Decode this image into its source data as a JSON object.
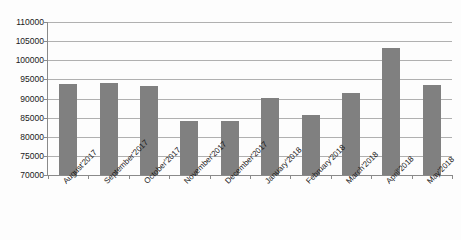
{
  "chart_data": {
    "type": "bar",
    "title": "",
    "subtitle": "",
    "xlabel": "",
    "ylabel": "",
    "categories": [
      "August'2017",
      "September'2017",
      "October'2017",
      "November'2017",
      "December'2017",
      "January'2018",
      "February'2018",
      "March'2018",
      "April'2018",
      "May'2018"
    ],
    "values": [
      93800,
      94000,
      93400,
      84000,
      84100,
      90100,
      85600,
      91500,
      103100,
      93600
    ],
    "ylim": [
      70000,
      110000
    ],
    "ytick_labels": [
      "110000",
      "105000",
      "100000",
      "95000",
      "90000",
      "85000",
      "80000",
      "75000",
      "70000"
    ],
    "ytick_values": [
      110000,
      105000,
      100000,
      95000,
      90000,
      85000,
      80000,
      75000,
      70000
    ],
    "grid": true,
    "legend": false,
    "legend_position": "none",
    "bar_color": "#808080",
    "gridline_color": "#b0b0b0",
    "axis_color": "#8a8a8a",
    "background_color": "#fdfdfd",
    "text_color": "#1a1a1a"
  }
}
